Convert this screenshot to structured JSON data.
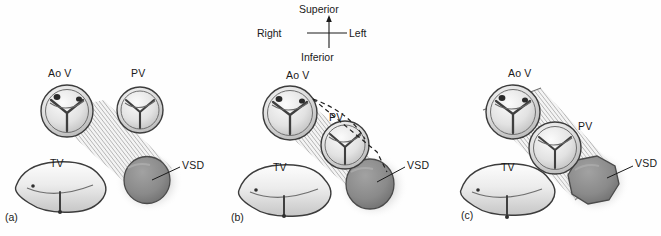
{
  "figure": {
    "caption_letters": [
      "(a)",
      "(b)",
      "(c)"
    ],
    "background_color": "#fefefe",
    "ink_color": "#1a1a1a"
  },
  "compass": {
    "superior": "Superior",
    "inferior": "Inferior",
    "right": "Right",
    "left": "Left"
  },
  "panels": [
    {
      "letter": "(a)",
      "labels": {
        "aortic_valve": "Ao V",
        "pulmonary_valve": "PV",
        "tricuspid_valve": "TV",
        "vsd": "VSD"
      }
    },
    {
      "letter": "(b)",
      "labels": {
        "aortic_valve": "Ao V",
        "pulmonary_valve": "PV",
        "tricuspid_valve": "TV",
        "vsd": "VSD"
      }
    },
    {
      "letter": "(c)",
      "labels": {
        "aortic_valve": "Ao V",
        "pulmonary_valve": "PV",
        "tricuspid_valve": "TV",
        "vsd": "VSD"
      }
    }
  ],
  "colors": {
    "vsd_fill": "#8a8a8a",
    "vsd_stroke": "#4a4a4a",
    "valve_fill": "#e8e8e8",
    "valve_stroke": "#3c3c3c",
    "conduit_hatch": "#9a9a9a",
    "shadow": "#c8c8c8"
  }
}
